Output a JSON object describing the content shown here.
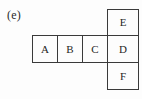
{
  "figure": {
    "panel_label": "(e)",
    "background_color": "#fdfdfd",
    "border_color": "#3a3a3a",
    "text_color": "#262626",
    "cells": [
      {
        "label": "A",
        "col": 0,
        "row": 1
      },
      {
        "label": "B",
        "col": 1,
        "row": 1
      },
      {
        "label": "C",
        "col": 2,
        "row": 1
      },
      {
        "label": "D",
        "col": 3,
        "row": 1
      },
      {
        "label": "E",
        "col": 3,
        "row": 0
      },
      {
        "label": "F",
        "col": 3,
        "row": 2
      }
    ]
  }
}
